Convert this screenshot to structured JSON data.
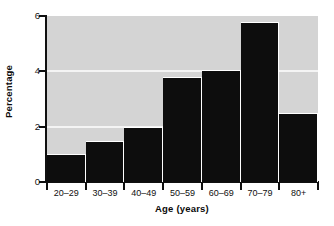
{
  "chart_data": {
    "type": "bar",
    "title": "",
    "subtitle": "",
    "xlabel": "Age (years)",
    "ylabel": "Percentage",
    "categories": [
      "20–29",
      "30–39",
      "40–49",
      "50–59",
      "60–69",
      "70–79",
      "80+"
    ],
    "values": [
      1.0,
      1.5,
      2.0,
      3.8,
      4.05,
      5.8,
      2.5
    ],
    "series": [
      {
        "name": "Percentage",
        "values": [
          1.0,
          1.5,
          2.0,
          3.8,
          4.05,
          5.8,
          2.5
        ]
      }
    ],
    "ylim": [
      0,
      6
    ],
    "xlim": [
      0,
      7
    ],
    "y_ticks": [
      0,
      2,
      4,
      6
    ],
    "y_tick_labels": [
      "0",
      "2",
      "4",
      "6"
    ],
    "x_tick_labels": [
      "20–29",
      "30–39",
      "40–49",
      "50–59",
      "60–69",
      "70–79",
      "80+"
    ],
    "grid": true,
    "gridlines_at": [
      2,
      4
    ],
    "legend": null,
    "legend_position": "none",
    "annotations": [],
    "colors": {
      "bar": "#0d0d0d",
      "plot_background": "#d4d4d4",
      "gridline": "#f4f4f4",
      "axis": "#101010",
      "figure_background": "#ffffff",
      "bar_separator": "#ffffff"
    }
  },
  "axes": {
    "y_title": "Percentage",
    "x_title": "Age (years)"
  }
}
